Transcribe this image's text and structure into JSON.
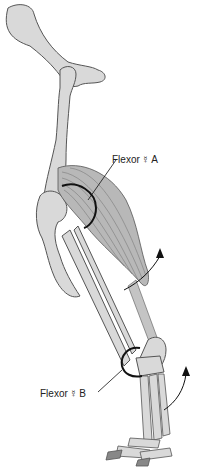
{
  "diagram": {
    "type": "anatomical-illustration",
    "colors": {
      "bone_fill": "#d9d9d9",
      "bone_stroke": "#555555",
      "muscle_fill": "#b8b8b8",
      "muscle_lines": "#6e6e6e",
      "annotation": "#111111"
    },
    "labels": [
      {
        "id": "flexor-a",
        "text": "Flexor",
        "symbol": "☿",
        "suffix": "A"
      },
      {
        "id": "flexor-b",
        "text": "Flexor",
        "symbol": "☿",
        "suffix": "B"
      }
    ],
    "arrows": [
      {
        "id": "arrow-upper",
        "direction": "up-curved"
      },
      {
        "id": "arrow-lower",
        "direction": "up-curved"
      }
    ]
  }
}
